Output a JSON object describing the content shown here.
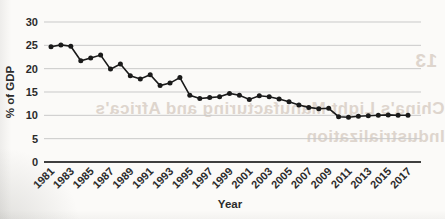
{
  "chart_data": {
    "type": "line",
    "title": "",
    "xlabel": "Year",
    "ylabel": "% of GDP",
    "x": [
      1981,
      1982,
      1983,
      1984,
      1985,
      1986,
      1987,
      1988,
      1989,
      1990,
      1991,
      1992,
      1993,
      1994,
      1995,
      1996,
      1997,
      1998,
      1999,
      2000,
      2001,
      2002,
      2003,
      2004,
      2005,
      2006,
      2007,
      2008,
      2009,
      2010,
      2011,
      2012,
      2013,
      2014,
      2015,
      2016,
      2017
    ],
    "values": [
      24.7,
      25.1,
      24.8,
      21.7,
      22.3,
      22.9,
      19.9,
      21.0,
      18.5,
      17.8,
      18.7,
      16.4,
      16.9,
      18.1,
      14.3,
      13.6,
      13.8,
      14.0,
      14.7,
      14.3,
      13.4,
      14.2,
      14.0,
      13.5,
      12.9,
      12.2,
      11.7,
      11.4,
      11.5,
      9.7,
      9.6,
      9.8,
      9.9,
      10.0,
      10.1,
      10.0,
      10.0
    ],
    "x_tick_labels": [
      "1981",
      "1983",
      "1985",
      "1987",
      "1989",
      "1991",
      "1993",
      "1995",
      "1997",
      "1999",
      "2001",
      "2003",
      "2005",
      "2007",
      "2009",
      "2011",
      "2013",
      "2015",
      "2017"
    ],
    "y_ticks": [
      0,
      5,
      10,
      15,
      20,
      25,
      30
    ],
    "ylim": [
      0,
      30
    ],
    "xlim": [
      1981,
      2017
    ],
    "grid": "horizontal",
    "legend": "none",
    "marker": "filled-circle",
    "line_color": "#1a1a1a"
  },
  "ghost_text": {
    "page_number": "13",
    "heading_line_1": "China's Light Manufacturing and Africa's",
    "heading_line_2": "Industrialization"
  },
  "colors": {
    "page_background": "#fbfaf8",
    "gridline": "#c9c9c9",
    "axis_line": "#3f3f3f",
    "series": "#1a1a1a",
    "tick_text": "#2b2b2b",
    "bleed_through_text": "#c7b7ab"
  }
}
